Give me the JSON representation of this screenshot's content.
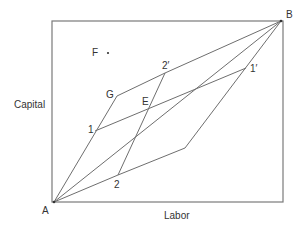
{
  "diagram": {
    "type": "edgeworth-box",
    "axis_labels": {
      "x": "Labor",
      "y": "Capital"
    },
    "origins": {
      "bottom_left": "A",
      "top_right": "B"
    },
    "point_labels": {
      "F": "F",
      "G": "G",
      "E": "E",
      "one": "1",
      "two": "2",
      "one_prime": "1′",
      "two_prime": "2′"
    },
    "colors": {
      "line": "#6e6e6e",
      "box": "#6e6e6e",
      "text": "#333333"
    }
  }
}
